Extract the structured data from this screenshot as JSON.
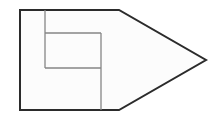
{
  "figure": {
    "name": "pentagon-with-nested-rectangles",
    "canvas": {
      "width": 221,
      "height": 120,
      "background_color": "#ffffff"
    },
    "style": {
      "outer_stroke_color": "#2b2b2b",
      "outer_stroke_width": 2,
      "inner_stroke_color": "#868686",
      "inner_stroke_width": 1.3,
      "fill_color": "#fcfcfc"
    },
    "shapes": {
      "outer_outline": {
        "label": "pentagon-outline",
        "points": "20,10 119,10 206,60 119,110 20,110",
        "vertices": [
          {
            "name": "top-left",
            "x": 20,
            "y": 10
          },
          {
            "name": "top-right",
            "x": 119,
            "y": 10
          },
          {
            "name": "right-point",
            "x": 206,
            "y": 60
          },
          {
            "name": "bottom-right",
            "x": 119,
            "y": 110
          },
          {
            "name": "bottom-left",
            "x": 20,
            "y": 110
          }
        ]
      },
      "inner_lines": [
        {
          "label": "left-vertical-divider",
          "orientation": "vertical",
          "x1": 45,
          "y1": 10,
          "x2": 45,
          "y2": 68
        },
        {
          "label": "right-vertical-divider",
          "orientation": "vertical",
          "x1": 101,
          "y1": 33,
          "x2": 101,
          "y2": 110
        },
        {
          "label": "upper-horizontal-divider",
          "orientation": "horizontal",
          "x1": 45,
          "y1": 33,
          "x2": 101,
          "y2": 33
        },
        {
          "label": "lower-horizontal-divider",
          "orientation": "horizontal",
          "x1": 45,
          "y1": 68,
          "x2": 101,
          "y2": 68
        }
      ]
    }
  }
}
